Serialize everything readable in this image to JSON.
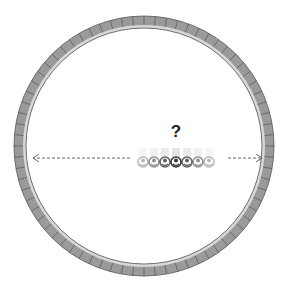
{
  "diagram": {
    "type": "ring-with-particles",
    "ring": {
      "center": [
        144,
        146
      ],
      "outer_radius": 130,
      "inner_radius": 118,
      "segments": 72,
      "fill": "#9a9a9a",
      "segment_line": "#555555",
      "inner_band": "#d8d8d8"
    },
    "question_mark": "?",
    "arrows": {
      "left": {
        "from": [
          130,
          158
        ],
        "to": [
          33,
          158
        ],
        "style": "dashed"
      },
      "right": {
        "from": [
          228,
          158
        ],
        "to": [
          262,
          158
        ],
        "style": "dashed"
      }
    },
    "particles": {
      "count": 7,
      "y": 162,
      "x": [
        143,
        154,
        165,
        176,
        187,
        198,
        209
      ],
      "opacity": [
        0.35,
        0.55,
        0.8,
        1.0,
        0.8,
        0.55,
        0.35
      ],
      "color": "#3a3a3a"
    }
  }
}
